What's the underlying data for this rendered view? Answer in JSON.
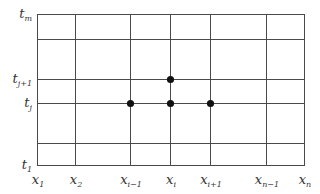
{
  "diagram": {
    "type": "finite-difference-grid",
    "colors": {
      "line": "#4a4a4a",
      "node": "#111111",
      "text": "#333333"
    },
    "grid": {
      "x_lines": [
        37,
        75,
        130,
        170,
        210,
        266,
        304
      ],
      "y_lines": [
        14,
        39,
        79,
        103,
        143,
        165
      ]
    },
    "x_labels": [
      {
        "base": "x",
        "sub": "1",
        "x": 37
      },
      {
        "base": "x",
        "sub": "2",
        "x": 75
      },
      {
        "base": "x",
        "sub": "i−1",
        "x": 130
      },
      {
        "base": "x",
        "sub": "i",
        "x": 170
      },
      {
        "base": "x",
        "sub": "i+1",
        "x": 210
      },
      {
        "base": "x",
        "sub": "n−1",
        "x": 266
      },
      {
        "base": "x",
        "sub": "n",
        "x": 304
      }
    ],
    "y_labels": [
      {
        "base": "t",
        "sub": "m",
        "y": 14
      },
      {
        "base": "t",
        "sub": "j+1",
        "y": 79
      },
      {
        "base": "t",
        "sub": "j",
        "y": 103
      },
      {
        "base": "t",
        "sub": "1",
        "y": 165
      }
    ],
    "nodes": [
      {
        "name": "node-i-jplus1",
        "x": 170,
        "y": 79
      },
      {
        "name": "node-iminus1-j",
        "x": 130,
        "y": 103
      },
      {
        "name": "node-i-j",
        "x": 170,
        "y": 103
      },
      {
        "name": "node-iplus1-j",
        "x": 210,
        "y": 103
      }
    ]
  }
}
